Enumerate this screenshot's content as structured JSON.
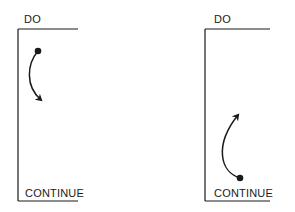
{
  "diagrams": [
    {
      "id": "left",
      "top_label": "DO",
      "bottom_label": "CONTINUE",
      "arrow_direction": "down",
      "dot_position": "top"
    },
    {
      "id": "right",
      "top_label": "DO",
      "bottom_label": "CONTINUE",
      "arrow_direction": "up",
      "dot_position": "bottom"
    }
  ],
  "colors": {
    "stroke": "#1a1a1a",
    "background": "#ffffff"
  }
}
